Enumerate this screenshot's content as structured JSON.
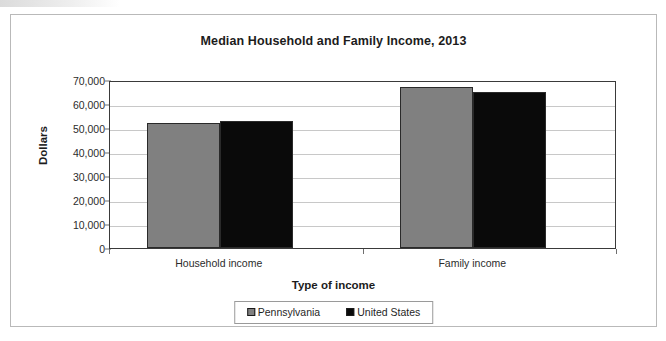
{
  "chart_data": {
    "type": "bar",
    "title": "Median Household and Family Income, 2013",
    "xlabel": "Type of income",
    "ylabel": "Dollars",
    "categories": [
      "Household income",
      "Family income"
    ],
    "series": [
      {
        "name": "Pennsylvania",
        "color": "#808080",
        "values": [
          52000,
          67000
        ]
      },
      {
        "name": "United States",
        "color": "#0a0a0a",
        "values": [
          53000,
          65000
        ]
      }
    ],
    "ylim": [
      0,
      70000
    ],
    "ytick_values": [
      0,
      10000,
      20000,
      30000,
      40000,
      50000,
      60000,
      70000
    ],
    "ytick_labels": [
      "0",
      "10,000",
      "20,000",
      "30,000",
      "40,000",
      "50,000",
      "60,000",
      "70,000"
    ],
    "grid": true,
    "legend_position": "bottom"
  },
  "legend": {
    "items": [
      {
        "label": "Pennsylvania",
        "swatch": "gray-square-swatch"
      },
      {
        "label": "United States",
        "swatch": "black-square-swatch"
      }
    ]
  }
}
